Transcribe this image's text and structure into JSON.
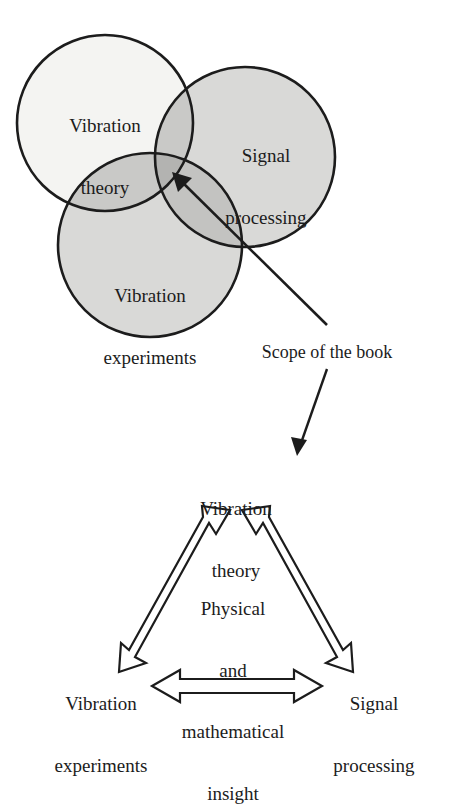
{
  "figure": {
    "background_color": "#ffffff",
    "ink_color": "#1c1c1c"
  },
  "venn": {
    "circles": [
      {
        "id": "vibration-theory",
        "label": "Vibration\ntheory",
        "label_line1": "Vibration",
        "label_line2": "theory",
        "cx": 105,
        "cy": 123,
        "r": 88,
        "fill": "#f4f4f2",
        "stroke": "#1c1c1c",
        "label_x": 105,
        "label_y": 92
      },
      {
        "id": "signal-processing",
        "label": "Signal\nprocessing",
        "label_line1": "Signal",
        "label_line2": "processing",
        "cx": 245,
        "cy": 157,
        "r": 90,
        "fill": "#d9d9d7",
        "stroke": "#1c1c1c",
        "label_x": 266,
        "label_y": 118
      },
      {
        "id": "vibration-experiments",
        "label": "Vibration\nexperiments",
        "label_line1": "Vibration",
        "label_line2": "experiments",
        "cx": 150,
        "cy": 245,
        "r": 92,
        "fill": "#d9d9d7",
        "stroke": "#1c1c1c",
        "label_x": 150,
        "label_y": 245
      }
    ],
    "overlap_fills": {
      "theory_signal": "#c7c7c5",
      "theory_experiments": "#c7c7c5",
      "signal_experiments": "#c2c2c0",
      "triple": "#b4b4b2"
    }
  },
  "scope": {
    "callout_text": "Scope of the book",
    "callout_x": 326,
    "callout_y": 354,
    "pointer_arrow": {
      "from_x": 327,
      "from_y": 325,
      "to_x": 174,
      "to_y": 174,
      "style": "thin-solid-arrow"
    },
    "down_arrow": {
      "from_x": 327,
      "from_y": 369,
      "to_x": 298,
      "to_y": 454,
      "style": "thin-solid-arrow"
    }
  },
  "triangle": {
    "nodes": [
      {
        "id": "vibration-theory",
        "line1": "Vibration",
        "line2": "theory",
        "x": 236,
        "y": 472
      },
      {
        "id": "vibration-experiments",
        "line1": "Vibration",
        "line2": "experiments",
        "x": 101,
        "y": 676
      },
      {
        "id": "signal-processing",
        "line1": "Signal",
        "line2": "processing",
        "x": 374,
        "y": 676
      }
    ],
    "center_text": {
      "lines": [
        "Physical",
        "and",
        "mathematical",
        "insight"
      ],
      "x": 233,
      "y": 610
    },
    "arrows": [
      {
        "id": "arrow-experiments-theory",
        "from": "vibration-experiments",
        "to": "vibration-theory",
        "double_headed": true,
        "style": "hollow-outline"
      },
      {
        "id": "arrow-theory-signal",
        "from": "vibration-theory",
        "to": "signal-processing",
        "double_headed": true,
        "style": "hollow-outline"
      },
      {
        "id": "arrow-experiments-signal",
        "from": "vibration-experiments",
        "to": "signal-processing",
        "double_headed": true,
        "style": "hollow-outline"
      }
    ]
  }
}
